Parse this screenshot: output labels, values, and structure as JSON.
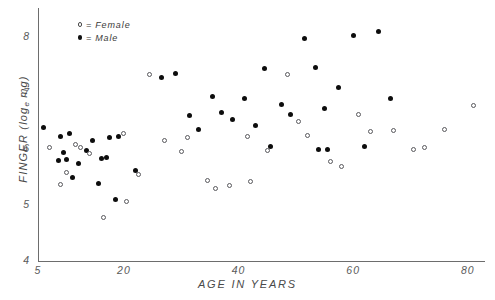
{
  "chart_data": {
    "type": "scatter",
    "title": "",
    "xlabel": "AGE IN YEARS",
    "ylabel": "FINGER (log_e mg)",
    "ylabel_main": "FINGER (log",
    "ylabel_sub": "e",
    "ylabel_tail": " mg)",
    "xlim": [
      5,
      83
    ],
    "ylim": [
      4,
      8.45
    ],
    "xticks": [
      5,
      20,
      40,
      60,
      80
    ],
    "yticks": [
      4,
      5,
      6,
      7,
      8
    ],
    "xticklabels": [
      "5",
      "20",
      "40",
      "60",
      "80"
    ],
    "yticklabels": [
      "4",
      "5",
      "6",
      "7",
      "8"
    ],
    "grid": false,
    "legend_position": "upper-left-inside",
    "legend": [
      {
        "marker": "open-circle",
        "separator": "=",
        "label": "Female"
      },
      {
        "marker": "filled-circle",
        "separator": "=",
        "label": "Male"
      }
    ],
    "series": [
      {
        "name": "Male",
        "marker": "filled-circle",
        "color": "#0d0d0d",
        "points": [
          [
            6.0,
            6.38
          ],
          [
            9.0,
            6.22
          ],
          [
            10.5,
            6.27
          ],
          [
            9.5,
            5.93
          ],
          [
            8.5,
            5.8
          ],
          [
            10.0,
            5.82
          ],
          [
            12.0,
            5.74
          ],
          [
            11.0,
            5.5
          ],
          [
            13.5,
            5.97
          ],
          [
            14.5,
            6.15
          ],
          [
            16.0,
            5.83
          ],
          [
            17.0,
            5.84
          ],
          [
            17.5,
            6.2
          ],
          [
            19.0,
            6.22
          ],
          [
            15.5,
            5.38
          ],
          [
            18.5,
            5.1
          ],
          [
            22.0,
            5.62
          ],
          [
            26.5,
            7.28
          ],
          [
            29.0,
            7.35
          ],
          [
            31.5,
            6.6
          ],
          [
            33.0,
            6.35
          ],
          [
            35.5,
            6.93
          ],
          [
            37.0,
            6.66
          ],
          [
            39.0,
            6.52
          ],
          [
            41.0,
            6.9
          ],
          [
            43.0,
            6.42
          ],
          [
            45.5,
            6.05
          ],
          [
            47.5,
            6.8
          ],
          [
            49.0,
            6.62
          ],
          [
            51.5,
            7.98
          ],
          [
            53.5,
            7.45
          ],
          [
            55.0,
            6.72
          ],
          [
            57.5,
            7.1
          ],
          [
            60.0,
            8.02
          ],
          [
            64.5,
            8.09
          ],
          [
            62.0,
            6.05
          ],
          [
            66.5,
            6.9
          ],
          [
            54.0,
            6.0
          ],
          [
            55.5,
            5.99
          ],
          [
            44.5,
            7.43
          ]
        ]
      },
      {
        "name": "Female",
        "marker": "open-circle",
        "color": "#ffffff",
        "points": [
          [
            7.0,
            6.02
          ],
          [
            11.5,
            6.08
          ],
          [
            12.5,
            6.02
          ],
          [
            10.0,
            5.58
          ],
          [
            9.0,
            5.36
          ],
          [
            14.0,
            5.92
          ],
          [
            16.5,
            4.77
          ],
          [
            20.5,
            5.06
          ],
          [
            22.5,
            5.55
          ],
          [
            24.5,
            7.33
          ],
          [
            27.0,
            6.15
          ],
          [
            31.0,
            6.2
          ],
          [
            30.0,
            5.96
          ],
          [
            34.5,
            5.43
          ],
          [
            36.0,
            5.3
          ],
          [
            38.5,
            5.35
          ],
          [
            42.0,
            5.42
          ],
          [
            45.0,
            5.98
          ],
          [
            48.5,
            7.33
          ],
          [
            50.5,
            6.5
          ],
          [
            52.0,
            6.25
          ],
          [
            56.0,
            5.78
          ],
          [
            58.0,
            5.68
          ],
          [
            61.0,
            6.62
          ],
          [
            63.0,
            6.32
          ],
          [
            67.0,
            6.33
          ],
          [
            70.5,
            6.0
          ],
          [
            72.5,
            6.02
          ],
          [
            76.0,
            6.35
          ],
          [
            81.0,
            6.78
          ],
          [
            20.0,
            6.28
          ],
          [
            41.5,
            6.22
          ]
        ]
      }
    ]
  }
}
